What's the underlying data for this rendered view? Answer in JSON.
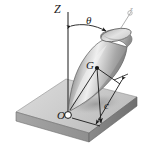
{
  "labels": {
    "vertical_axis": "Z",
    "angle": "θ",
    "mass_center": "G",
    "origin": "O",
    "distance": "c",
    "body_axis": "z"
  },
  "colors": {
    "line": "#1a1a1a",
    "plate_top": "#c6c6c6",
    "plate_front": "#9a9a9a",
    "plate_side": "#7d7d7d",
    "cone_light": "#ededed",
    "cone_mid": "#b4b4b4",
    "cone_dark": "#6e6e6e",
    "cone_edge": "#4a4a4a",
    "rim_inner": "#d8d8d8",
    "shadow": "#a8a8a8",
    "background": "#ffffff"
  },
  "geometry": {
    "origin_point": {
      "x": 68,
      "y": 112
    },
    "mass_center_point": {
      "x": 97,
      "y": 68
    },
    "z_axis_top": {
      "x": 68,
      "y": 12
    },
    "body_axis_top": {
      "x": 131,
      "y": 11
    },
    "theta_degrees": 32
  }
}
